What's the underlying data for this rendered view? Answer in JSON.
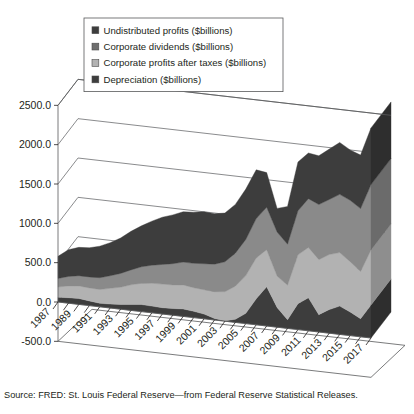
{
  "chart_data": {
    "type": "area",
    "subtype": "stacked-area-3d",
    "title": "",
    "subtitle": "",
    "xlabel": "",
    "ylabel": "",
    "ylim": [
      -500.0,
      2500.0
    ],
    "ytick_values": [
      2500.0,
      2000.0,
      1500.0,
      1000.0,
      500.0,
      0.0,
      -500.0
    ],
    "ytick_labels": [
      "2500.0",
      "2000.0",
      "1500.0",
      "1000.0",
      "500.0",
      "0.0",
      "-500.0"
    ],
    "grid": true,
    "grid_axis": "y",
    "legend_position": "top-left-inside",
    "x": [
      1987,
      1988,
      1989,
      1990,
      1991,
      1992,
      1993,
      1994,
      1995,
      1996,
      1997,
      1998,
      1999,
      2000,
      2001,
      2002,
      2003,
      2004,
      2005,
      2006,
      2007,
      2008,
      2009,
      2010,
      2011,
      2012,
      2013,
      2014,
      2015,
      2016,
      2017
    ],
    "xtick_labels": [
      "1987",
      "1989",
      "1991",
      "1993",
      "1995",
      "1997",
      "1999",
      "2001",
      "2003",
      "2005",
      "2007",
      "2009",
      "2011",
      "2013",
      "2015",
      "2017"
    ],
    "xtick_label_step": 2,
    "stack_order_bottom_to_top": [
      "Depreciation ($billions)",
      "Corporate profits after taxes ($billions)",
      "Corporate dividends ($billions)",
      "Undistributed profits ($billions)"
    ],
    "series": [
      {
        "name": "Depreciation ($billions)",
        "color": "#3d3d3d",
        "legend_index": 3,
        "values": [
          60,
          70,
          75,
          60,
          45,
          50,
          60,
          75,
          90,
          85,
          80,
          85,
          95,
          80,
          60,
          20,
          5,
          40,
          130,
          330,
          500,
          250,
          110,
          330,
          420,
          220,
          300,
          360,
          300,
          230,
          420
        ]
      },
      {
        "name": "Corporate profits after taxes ($billions)",
        "color": "#b2b2b2",
        "legend_index": 2,
        "values": [
          130,
          150,
          160,
          165,
          175,
          200,
          220,
          250,
          270,
          290,
          300,
          300,
          305,
          300,
          310,
          340,
          370,
          420,
          480,
          520,
          470,
          400,
          440,
          620,
          640,
          700,
          700,
          680,
          640,
          600,
          700
        ]
      },
      {
        "name": "Corporate dividends ($billions)",
        "color": "#8a8a8a",
        "legend_index": 1,
        "values": [
          110,
          120,
          130,
          140,
          150,
          160,
          175,
          190,
          210,
          230,
          250,
          270,
          290,
          310,
          330,
          350,
          380,
          420,
          460,
          500,
          540,
          560,
          520,
          560,
          620,
          700,
          700,
          740,
          780,
          800,
          830
        ]
      },
      {
        "name": "Undistributed profits ($billions)",
        "color": "#3d3d3d",
        "legend_index": 0,
        "values": [
          280,
          340,
          360,
          370,
          400,
          420,
          450,
          490,
          520,
          560,
          600,
          620,
          640,
          650,
          660,
          640,
          620,
          620,
          640,
          620,
          440,
          300,
          480,
          620,
          580,
          620,
          640,
          660,
          640,
          680,
          720
        ]
      }
    ],
    "annotations": []
  },
  "legend": {
    "items": [
      {
        "label": "Undistributed profits ($billions)",
        "color": "#3d3d3d",
        "swatch_name": "legend-swatch-undistributed-profits"
      },
      {
        "label": "Corporate dividends ($billions)",
        "color": "#6e6e6e",
        "swatch_name": "legend-swatch-corporate-dividends"
      },
      {
        "label": "Corporate profits after taxes ($billions)",
        "color": "#b2b2b2",
        "swatch_name": "legend-swatch-corporate-profits-after-taxes"
      },
      {
        "label": "Depreciation ($billions)",
        "color": "#3d3d3d",
        "swatch_name": "legend-swatch-depreciation"
      }
    ]
  },
  "yaxis": {
    "labels": [
      "2500.0",
      "2000.0",
      "1500.0",
      "1000.0",
      "500.0",
      "0.0",
      "-500.0"
    ]
  },
  "xaxis": {
    "labels": [
      "1987",
      "1989",
      "1991",
      "1993",
      "1995",
      "1997",
      "1999",
      "2001",
      "2003",
      "2005",
      "2007",
      "2009",
      "2011",
      "2013",
      "2015",
      "2017"
    ]
  },
  "caption": {
    "source": "Source: FRED: St. Louis Federal Reserve—from Federal Reserve Statistical Releases."
  },
  "colors": {
    "ink": "#231f20",
    "axis": "#58595b",
    "band_dark": "#3d3d3d",
    "band_mid": "#8a8a8a",
    "band_light": "#b2b2b2",
    "background": "#ffffff"
  }
}
